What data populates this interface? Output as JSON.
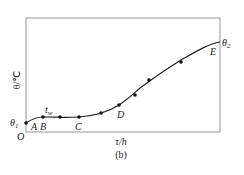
{
  "chart_data": {
    "type": "line",
    "title": "",
    "caption": "(b)",
    "xlabel": "τ/h",
    "ylabel": "θ/℃",
    "origin_label": "O",
    "grid": false,
    "legend": null,
    "frame": "box",
    "start_label": "θ1",
    "end_label": "θ2",
    "annotation_tw": "tw",
    "point_labels": [
      "A",
      "B",
      "C",
      "D",
      "E"
    ],
    "series": [
      {
        "name": "measured points",
        "points_px": [
          {
            "x": 26,
            "y": 123
          },
          {
            "x": 43,
            "y": 117
          },
          {
            "x": 60,
            "y": 117
          },
          {
            "x": 79,
            "y": 117
          },
          {
            "x": 101,
            "y": 113
          },
          {
            "x": 119,
            "y": 105
          },
          {
            "x": 135,
            "y": 95
          },
          {
            "x": 149,
            "y": 80
          },
          {
            "x": 181,
            "y": 62
          }
        ]
      }
    ],
    "curve_path": "M26,123 C32,119 36,117 43,117 C55,117 65,118 79,117 C92,116 108,112 119,105 C128,99 132,95 140,88 C155,77 168,68 181,60 C195,52 208,44 220,42"
  },
  "labels": {
    "theta1": "θ",
    "theta1_sub": "1",
    "theta2": "θ",
    "theta2_sub": "2",
    "tw": "t",
    "tw_sub": "w",
    "A": "A",
    "B": "B",
    "C": "C",
    "D": "D",
    "E": "E",
    "O": "O",
    "xlabel": "τ/h",
    "ylabel": "θ/℃",
    "caption": "(b)"
  },
  "colors": {
    "frame": "#a8a8a8",
    "curve": "#222222",
    "points": "#111111"
  }
}
